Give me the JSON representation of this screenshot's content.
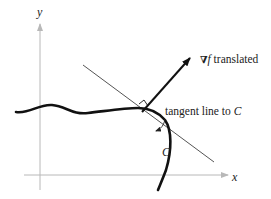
{
  "diagram": {
    "axes": {
      "x_label": "x",
      "y_label": "y",
      "axis_color": "#b8b8b8"
    },
    "curve": {
      "label": "C",
      "color": "#111111"
    },
    "gradient_vector": {
      "symbol": "∇",
      "func": "f",
      "suffix": " translated",
      "color": "#111111"
    },
    "tangent_line": {
      "text_prefix": "tangent line to ",
      "text_curve": "C",
      "color": "#444444"
    },
    "right_angle_marker": true
  }
}
